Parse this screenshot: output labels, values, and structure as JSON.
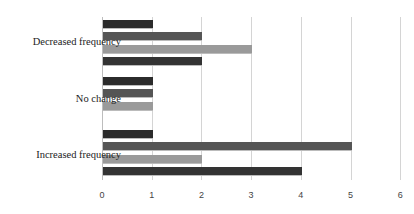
{
  "chart_data": {
    "type": "bar",
    "orientation": "horizontal",
    "title": "",
    "xlabel": "",
    "ylabel": "",
    "categories": [
      "Decreased frequency",
      "No change",
      "Increased frequency"
    ],
    "series": [
      {
        "name": "Series 1",
        "color": "#2b2b2b",
        "values": [
          1,
          1,
          1
        ]
      },
      {
        "name": "Series 2",
        "color": "#555555",
        "values": [
          2,
          1,
          5
        ]
      },
      {
        "name": "Series 3",
        "color": "#9a9a9a",
        "values": [
          3,
          1,
          2
        ]
      },
      {
        "name": "Series 4",
        "color": "#333333",
        "values": [
          2,
          0,
          4
        ]
      }
    ],
    "xlim": [
      0,
      6
    ],
    "xticks": [
      "0",
      "1",
      "2",
      "3",
      "4",
      "5",
      "6"
    ],
    "grid": true,
    "legend": "none"
  }
}
